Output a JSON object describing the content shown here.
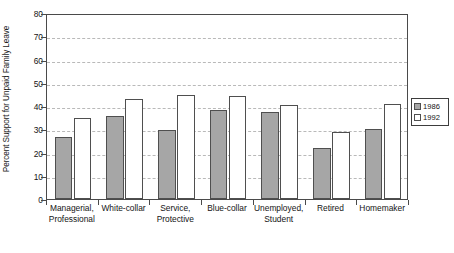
{
  "chart_data": {
    "type": "bar",
    "title": "",
    "xlabel": "",
    "ylabel": "Percent Support for Unpaid Family Leave",
    "ylim": [
      0,
      80
    ],
    "yticks": [
      0,
      10,
      20,
      30,
      40,
      50,
      60,
      70,
      80
    ],
    "grid": true,
    "legend_position": "right-outside",
    "categories": [
      "Managerial,\nProfessional",
      "White-collar",
      "Service,\nProtective",
      "Blue-collar",
      "Unemployed,\nStudent",
      "Retired",
      "Homemaker"
    ],
    "series": [
      {
        "name": "1986",
        "color": "#a6a6a6",
        "values": [
          26.5,
          35.5,
          29.8,
          38.2,
          37.5,
          21.8,
          30.0
        ]
      },
      {
        "name": "1992",
        "color": "#ffffff",
        "values": [
          34.7,
          43.0,
          44.7,
          44.5,
          40.5,
          28.7,
          40.7
        ]
      }
    ]
  },
  "legend": {
    "items": [
      {
        "label": "1986",
        "swatch": "filled-gray-square"
      },
      {
        "label": "1992",
        "swatch": "open-white-square"
      }
    ]
  }
}
